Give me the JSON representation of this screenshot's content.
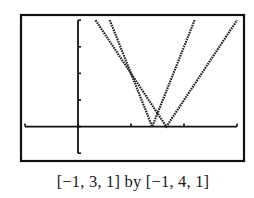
{
  "chart_data": {
    "type": "line",
    "title": "",
    "caption": "[−1, 3, 1] by [−1, 4, 1]",
    "window": {
      "xmin": -1,
      "xmax": 3,
      "xscl": 1,
      "ymin": -1,
      "ymax": 4,
      "yscl": 1
    },
    "xlabel": "",
    "ylabel": "",
    "grid": false,
    "legend": null,
    "series": [
      {
        "name": "y = |5x - 7|",
        "shape": "V",
        "vertex": [
          1.4,
          0
        ],
        "points": [
          [
            0.6,
            4
          ],
          [
            1.4,
            0
          ],
          [
            2.2,
            4
          ]
        ]
      },
      {
        "name": "y = |3x - 5|",
        "shape": "V",
        "vertex": [
          1.667,
          0
        ],
        "points": [
          [
            0.333,
            4
          ],
          [
            1.667,
            0
          ],
          [
            3.0,
            4
          ]
        ]
      }
    ],
    "intersections": [
      [
        1,
        2
      ],
      [
        1.5,
        0.5
      ]
    ],
    "x_ticks": [
      -1,
      0,
      1,
      2,
      3
    ],
    "y_ticks": [
      -1,
      0,
      1,
      2,
      3,
      4
    ]
  },
  "screen": {
    "frame": {
      "x": 21,
      "y": 15,
      "w": 223,
      "h": 146
    },
    "px_origin": {
      "x": 78,
      "y": 126.6
    },
    "px_per_unit": {
      "x": 53,
      "y": 26.6
    },
    "line_color": "#222222",
    "axis_color": "#111111"
  }
}
